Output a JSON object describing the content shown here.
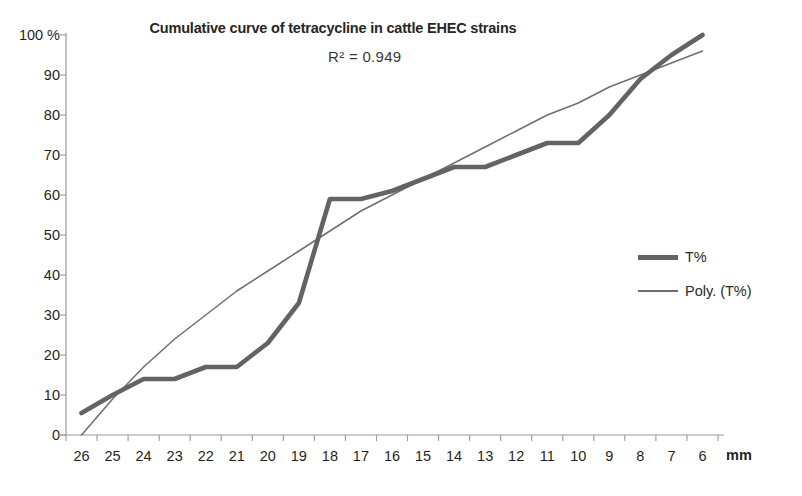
{
  "chart_data": {
    "type": "line",
    "title": "Cumulative curve of tetracycline in cattle EHEC strains",
    "annotation": "R² = 0.949",
    "r_squared": 0.949,
    "xlabel": "mm",
    "ylabel": "%",
    "ylim": [
      0,
      100
    ],
    "yticks": [
      0,
      10,
      20,
      30,
      40,
      50,
      60,
      70,
      80,
      90,
      100
    ],
    "ytick_labels": [
      "0",
      "10",
      "20",
      "30",
      "40",
      "50",
      "60",
      "70",
      "80",
      "90",
      "100"
    ],
    "y_axis_unit": "%",
    "grid": false,
    "legend_position": "right",
    "categories": [
      26,
      25,
      24,
      23,
      22,
      21,
      20,
      19,
      18,
      17,
      16,
      15,
      14,
      13,
      12,
      11,
      10,
      9,
      8,
      7,
      6
    ],
    "xtick_labels": [
      "26",
      "25",
      "24",
      "23",
      "22",
      "21",
      "20",
      "19",
      "18",
      "17",
      "16",
      "15",
      "14",
      "13",
      "12",
      "11",
      "10",
      "9",
      "8",
      "7",
      "6"
    ],
    "series": [
      {
        "name": "T%",
        "style": "thick",
        "color": "#636363",
        "values": [
          5.5,
          10,
          14,
          14,
          17,
          17,
          23,
          33,
          59,
          59,
          61,
          64,
          67,
          67,
          70,
          73,
          73,
          80,
          89,
          95,
          100
        ]
      },
      {
        "name": "Poly. (T%)",
        "style": "thin",
        "color": "#6e6e6e",
        "values": [
          0,
          9,
          17,
          24,
          30,
          36,
          41,
          46,
          51,
          56,
          60,
          64,
          68,
          72,
          76,
          80,
          83,
          87,
          90,
          93,
          96
        ]
      }
    ]
  },
  "legend": {
    "items": [
      {
        "label": "T%"
      },
      {
        "label": "Poly. (T%)"
      }
    ]
  },
  "colors": {
    "series_primary": "#636363",
    "series_trend": "#6e6e6e",
    "axis": "#9a9a9a",
    "text": "#1f1f1f"
  }
}
